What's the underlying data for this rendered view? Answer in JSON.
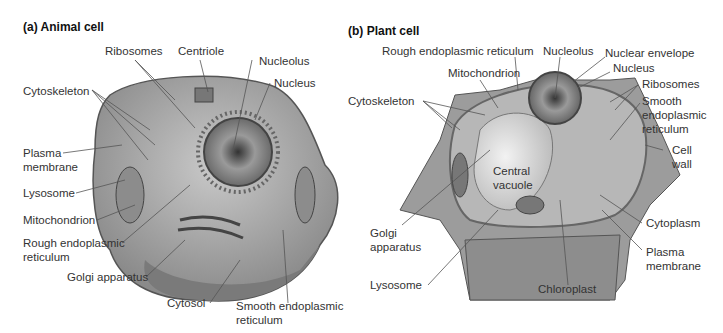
{
  "figure": {
    "panels": [
      {
        "id": "a",
        "title": "(a) Animal cell",
        "labels": {
          "ribosomes": "Ribosomes",
          "centriole": "Centriole",
          "nucleolus": "Nucleolus",
          "nucleus": "Nucleus",
          "cytoskeleton": "Cytoskeleton",
          "plasma_membrane_1": "Plasma",
          "plasma_membrane_2": "membrane",
          "lysosome": "Lysosome",
          "mitochondrion": "Mitochondrion",
          "rough_er_1": "Rough endoplasmic",
          "rough_er_2": "reticulum",
          "golgi": "Golgi apparatus",
          "cytosol": "Cytosol",
          "smooth_er_1": "Smooth endoplasmic",
          "smooth_er_2": "reticulum"
        }
      },
      {
        "id": "b",
        "title": "(b) Plant cell",
        "labels": {
          "rough_er": "Rough endoplasmic reticulum",
          "nucleolus": "Nucleolus",
          "nuclear_envelope": "Nuclear envelope",
          "nucleus": "Nucleus",
          "mitochondrion": "Mitochondrion",
          "ribosomes": "Ribosomes",
          "cytoskeleton": "Cytoskeleton",
          "smooth_er_1": "Smooth",
          "smooth_er_2": "endoplasmic",
          "smooth_er_3": "reticulum",
          "cell_wall_1": "Cell",
          "cell_wall_2": "wall",
          "central_vacuole_1": "Central",
          "central_vacuole_2": "vacuole",
          "golgi_1": "Golgi",
          "golgi_2": "apparatus",
          "cytoplasm": "Cytoplasm",
          "plasma_membrane_1": "Plasma",
          "plasma_membrane_2": "membrane",
          "lysosome": "Lysosome",
          "chloroplast": "Chloroplast"
        }
      }
    ]
  }
}
